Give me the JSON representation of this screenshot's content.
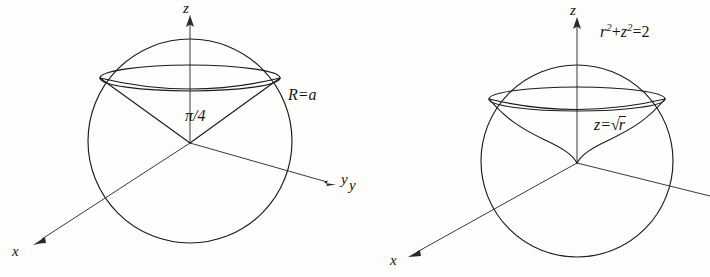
{
  "figure": {
    "background_color": "#fdfdfc",
    "line_color": "#1b1b1b",
    "panels": [
      {
        "id": "left-panel",
        "name": "cone-in-sphere",
        "description": "Sphere of radius a with inscribed cone of half-angle pi/4",
        "axes": [
          {
            "name": "z-axis",
            "label": "z",
            "direction": "up"
          },
          {
            "name": "y-axis",
            "label": "y",
            "direction": "right"
          },
          {
            "name": "x-axis",
            "label": "x",
            "direction": "down-left"
          }
        ],
        "annotations": [
          {
            "name": "angle-label",
            "text": "π/4"
          },
          {
            "name": "radius-label",
            "text": "R=a"
          }
        ],
        "sphere": {
          "center_x": 190,
          "center_y": 141,
          "radius": 102
        },
        "equator_ellipse": {
          "center_x": 190,
          "center_y": 78,
          "rx": 90,
          "ry": 13
        }
      },
      {
        "id": "right-panel",
        "name": "cusp-surface-in-sphere",
        "description": "Sphere r^2+z^2=2 with the surface z=sqrt(r) inscribed",
        "axes": [
          {
            "name": "z-axis",
            "label": "z",
            "direction": "up"
          },
          {
            "name": "y-axis",
            "label": "y",
            "direction": "right"
          },
          {
            "name": "x-axis",
            "label": "x",
            "direction": "down-left"
          }
        ],
        "annotations": [
          {
            "name": "sphere-equation-label",
            "text_parts": {
              "r": "r",
              "r_exp": "2",
              "plus": "+",
              "z": "z",
              "z_exp": "2",
              "eq": "=2"
            }
          },
          {
            "name": "surface-equation-label",
            "text_parts": {
              "lhs": "z=",
              "radical": "√",
              "radicand": "r"
            }
          }
        ],
        "sphere": {
          "center_x": 577,
          "center_y": 160,
          "radius": 96
        },
        "equator_ellipse": {
          "center_x": 577,
          "center_y": 98,
          "rx": 88,
          "ry": 12
        }
      }
    ],
    "labels": {
      "z_left": "z",
      "y_left": "y",
      "x_left": "x",
      "angle_left": "π/4",
      "radius_left": "R=a",
      "z_right": "z",
      "y_right": "y",
      "x_right": "x",
      "sphere_eq_r": "r",
      "sphere_eq_sup1": "2",
      "sphere_eq_mid": "+",
      "sphere_eq_z": "z",
      "sphere_eq_sup2": "2",
      "sphere_eq_tail": "=2",
      "surface_eq_lhs": "z=",
      "surface_eq_radical": "√",
      "surface_eq_radicand": "r"
    }
  }
}
